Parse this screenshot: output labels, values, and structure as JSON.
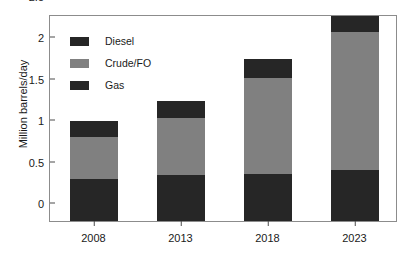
{
  "chart_data": {
    "type": "bar",
    "subtype": "stacked-vertical",
    "title": "",
    "xlabel": "",
    "ylabel": "Million barrels/day",
    "categories": [
      "2008",
      "2013",
      "2018",
      "2023"
    ],
    "ylim": [
      0,
      2.5
    ],
    "yticks": [
      0,
      0.5,
      1,
      1.5,
      2,
      2.5
    ],
    "ytick_labels": [
      "0",
      "0.5",
      "1",
      "1.5",
      "2",
      "2.5"
    ],
    "grid": false,
    "legend_position": "upper-left-inside",
    "series": [
      {
        "name": "Gas",
        "color": "#262626",
        "values": [
          0.51,
          0.55,
          0.57,
          0.62
        ]
      },
      {
        "name": "Crude/FO",
        "color": "#808080",
        "values": [
          0.5,
          0.7,
          1.16,
          1.66
        ]
      },
      {
        "name": "Diesel",
        "color": "#262626",
        "values": [
          0.2,
          0.2,
          0.23,
          0.2
        ]
      }
    ],
    "stack_order_bottom_to_top": [
      "Gas",
      "Crude/FO",
      "Diesel"
    ],
    "totals": [
      1.21,
      1.45,
      1.96,
      2.48
    ]
  },
  "legend": {
    "entries": [
      {
        "label": "Diesel",
        "color": "#262626"
      },
      {
        "label": "Crude/FO",
        "color": "#808080"
      },
      {
        "label": "Gas",
        "color": "#262626"
      }
    ]
  },
  "axes": {
    "y_title": "Million barrels/day",
    "frame_color": "#8c8c8c",
    "tick_color": "#4d4d4d",
    "text_color": "#1a1a1a"
  }
}
